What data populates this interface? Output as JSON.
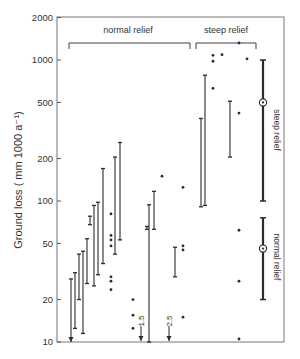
{
  "chart_data": {
    "type": "scatter",
    "title": "",
    "xlabel": "",
    "ylabel": "Ground loss ( mm 1000 a⁻¹)",
    "yscale": "log",
    "ylim": [
      10,
      2000
    ],
    "yticks": [
      10,
      20,
      50,
      100,
      200,
      500,
      1000,
      2000
    ],
    "ytick_labels": [
      "10",
      "20",
      "50",
      "100",
      "200",
      "500",
      "1000",
      "2000"
    ],
    "grid": false,
    "group_labels": [
      {
        "label": "normal relief",
        "x_start": 68,
        "x_end": 190
      },
      {
        "label": "steep relief",
        "x_start": 196,
        "x_end": 256
      }
    ],
    "range_bars": [
      {
        "x": 71,
        "high": 28,
        "low": 10,
        "low_arrow": true
      },
      {
        "x": 75,
        "high": 31,
        "low": 12.5
      },
      {
        "x": 79,
        "high": 42,
        "low": 20
      },
      {
        "x": 83,
        "high": 44,
        "low": 11.5
      },
      {
        "x": 87,
        "high": 54,
        "low": 26
      },
      {
        "x": 90,
        "high": 78,
        "low": 68
      },
      {
        "x": 94,
        "high": 93,
        "low": 25
      },
      {
        "x": 98,
        "high": 98,
        "low": 30
      },
      {
        "x": 103,
        "high": 170,
        "low": 36
      },
      {
        "x": 120,
        "high": 260,
        "low": 53
      },
      {
        "x": 115,
        "high": 205,
        "low": 42
      },
      {
        "x": 147,
        "high": 66,
        "low": 63
      },
      {
        "x": 149,
        "high": 94,
        "low": 10,
        "low_arrow": false
      },
      {
        "x": 154,
        "high": 117,
        "low": 63
      },
      {
        "x": 175,
        "high": 47,
        "low": 29
      },
      {
        "x": 201,
        "high": 385,
        "low": 91
      },
      {
        "x": 205,
        "high": 780,
        "low": 93
      },
      {
        "x": 230,
        "high": 510,
        "low": 205
      }
    ],
    "points": [
      {
        "x": 111,
        "y": 81
      },
      {
        "x": 111,
        "y": 57
      },
      {
        "x": 111,
        "y": 53
      },
      {
        "x": 111,
        "y": 48
      },
      {
        "x": 111,
        "y": 29
      },
      {
        "x": 111,
        "y": 27
      },
      {
        "x": 111,
        "y": 23.5
      },
      {
        "x": 133,
        "y": 20
      },
      {
        "x": 133,
        "y": 15.5
      },
      {
        "x": 133,
        "y": 12.5
      },
      {
        "x": 162,
        "y": 150
      },
      {
        "x": 183,
        "y": 125
      },
      {
        "x": 183,
        "y": 48
      },
      {
        "x": 183,
        "y": 45
      },
      {
        "x": 183,
        "y": 15
      },
      {
        "x": 213,
        "y": 1080
      },
      {
        "x": 213,
        "y": 980
      },
      {
        "x": 213,
        "y": 630
      },
      {
        "x": 222,
        "y": 1090
      },
      {
        "x": 239,
        "y": 1320
      },
      {
        "x": 247,
        "y": 1020
      },
      {
        "x": 239,
        "y": 420
      },
      {
        "x": 239,
        "y": 62
      },
      {
        "x": 239,
        "y": 27
      },
      {
        "x": 239,
        "y": 10.5
      }
    ],
    "arrows": [
      {
        "x": 141,
        "label": "1.5",
        "value": 1.5
      },
      {
        "x": 169,
        "label": "2.5",
        "value": 2.5
      }
    ],
    "summary_bars": [
      {
        "label": "steep relief",
        "x": 263,
        "high": 1000,
        "low": 100,
        "mean": 500
      },
      {
        "label": "normal relief",
        "x": 263,
        "high": 76,
        "low": 20,
        "mean": 46
      }
    ],
    "colors": {
      "ink": "#2b2b2b",
      "frame": "#777777",
      "background": "#ffffff"
    }
  },
  "labels": {
    "ylabel": "Ground loss ( mm 1000 a⁻¹)",
    "group_normal": "normal relief",
    "group_steep": "steep relief",
    "side_steep": "steep relief",
    "side_normal": "normal relief",
    "arrow_1": "1.5",
    "arrow_2": "2.5",
    "ticks": [
      "10",
      "20",
      "50",
      "100",
      "200",
      "500",
      "1000",
      "2000"
    ]
  }
}
